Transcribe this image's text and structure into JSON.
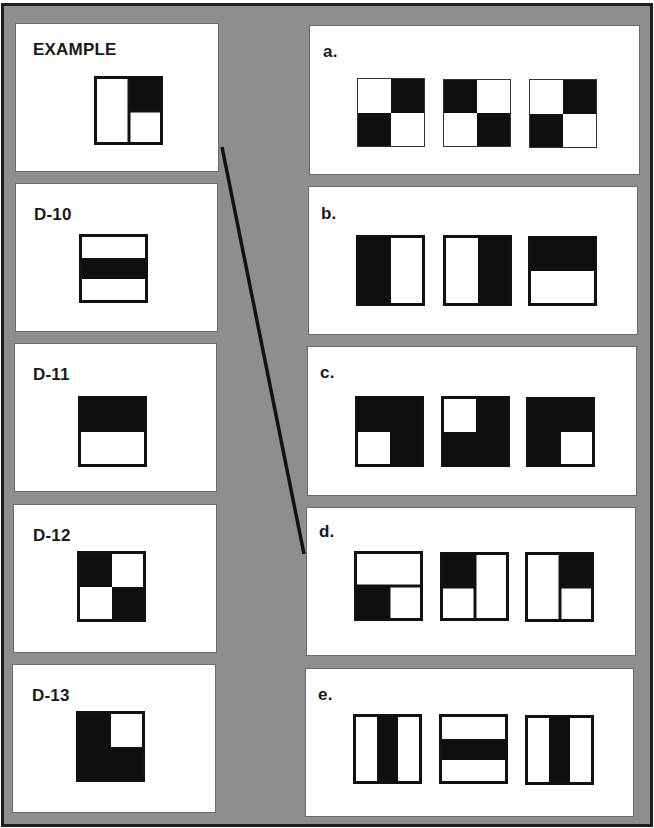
{
  "figure_legend": "fills are rectangles in percent of figure box [x,y,w,h]; dividers are internal black lines",
  "colors": {
    "background": "#8e8e8e",
    "panel": "#ffffff",
    "ink": "#111111",
    "frame_border": "#1e1e1e"
  },
  "left_panels": [
    {
      "id": "example",
      "label": "EXAMPLE",
      "box": [
        15,
        23,
        204,
        149
      ],
      "label_pos": [
        17,
        17
      ],
      "figure": {
        "box": [
          78,
          52,
          69,
          69
        ],
        "fills": [
          [
            50,
            0,
            50,
            50
          ]
        ],
        "v": [
          [
            50,
            0,
            100
          ]
        ],
        "h": [
          [
            50,
            50,
            100
          ]
        ]
      }
    },
    {
      "id": "d10",
      "label": "D-10",
      "box": [
        15,
        183,
        203,
        149
      ],
      "label_pos": [
        18,
        22
      ],
      "figure": {
        "box": [
          63,
          50,
          69,
          69
        ],
        "fills": [
          [
            0,
            33,
            100,
            33
          ]
        ],
        "v": [],
        "h": []
      }
    },
    {
      "id": "d11",
      "label": "D-11",
      "box": [
        14,
        343,
        203,
        149
      ],
      "label_pos": [
        18,
        22
      ],
      "figure": {
        "box": [
          63,
          52,
          69,
          71
        ],
        "fills": [
          [
            0,
            0,
            100,
            50
          ]
        ],
        "v": [],
        "h": []
      }
    },
    {
      "id": "d12",
      "label": "D-12",
      "box": [
        13,
        504,
        204,
        149
      ],
      "label_pos": [
        19,
        22
      ],
      "figure": {
        "box": [
          63,
          46,
          69,
          71
        ],
        "fills": [
          [
            0,
            0,
            50,
            50
          ],
          [
            50,
            50,
            50,
            50
          ]
        ],
        "v": [],
        "h": []
      }
    },
    {
      "id": "d13",
      "label": "D-13",
      "box": [
        12,
        664,
        204,
        149
      ],
      "label_pos": [
        19,
        22
      ],
      "figure": {
        "box": [
          63,
          46,
          69,
          71
        ],
        "fills": [
          [
            0,
            0,
            50,
            100
          ],
          [
            50,
            50,
            50,
            50
          ]
        ],
        "v": [],
        "h": []
      }
    }
  ],
  "right_panels": [
    {
      "id": "a",
      "label": "a.",
      "box": [
        309,
        25,
        331,
        150
      ],
      "label_pos": [
        13,
        17
      ],
      "thin": true,
      "figures": [
        {
          "box": [
            47,
            52,
            68,
            69
          ],
          "fills": [
            [
              50,
              0,
              50,
              50
            ],
            [
              0,
              50,
              50,
              50
            ]
          ],
          "v": [],
          "h": []
        },
        {
          "box": [
            133,
            53,
            68,
            68
          ],
          "fills": [
            [
              0,
              0,
              50,
              50
            ],
            [
              50,
              50,
              50,
              50
            ]
          ],
          "v": [],
          "h": []
        },
        {
          "box": [
            219,
            53,
            68,
            69
          ],
          "fills": [
            [
              50,
              0,
              50,
              50
            ],
            [
              0,
              50,
              50,
              50
            ]
          ],
          "v": [],
          "h": []
        }
      ]
    },
    {
      "id": "b",
      "label": "b.",
      "box": [
        308,
        186,
        330,
        149
      ],
      "label_pos": [
        12,
        18
      ],
      "figures": [
        {
          "box": [
            47,
            48,
            69,
            71
          ],
          "fills": [
            [
              0,
              0,
              50,
              100
            ]
          ],
          "v": [],
          "h": []
        },
        {
          "box": [
            134,
            48,
            69,
            71
          ],
          "fills": [
            [
              50,
              0,
              50,
              100
            ]
          ],
          "v": [],
          "h": []
        },
        {
          "box": [
            219,
            49,
            69,
            70
          ],
          "fills": [
            [
              0,
              0,
              100,
              50
            ]
          ],
          "v": [],
          "h": []
        }
      ]
    },
    {
      "id": "c",
      "label": "c.",
      "box": [
        307,
        346,
        330,
        150
      ],
      "label_pos": [
        12,
        17
      ],
      "figures": [
        {
          "box": [
            47,
            49,
            69,
            71
          ],
          "fills": [
            [
              0,
              0,
              100,
              50
            ],
            [
              50,
              50,
              50,
              50
            ]
          ],
          "v": [],
          "h": []
        },
        {
          "box": [
            133,
            49,
            69,
            71
          ],
          "fills": [
            [
              50,
              0,
              50,
              50
            ],
            [
              0,
              50,
              100,
              50
            ]
          ],
          "v": [],
          "h": []
        },
        {
          "box": [
            218,
            50,
            69,
            70
          ],
          "fills": [
            [
              0,
              0,
              100,
              50
            ],
            [
              0,
              50,
              50,
              50
            ]
          ],
          "v": [],
          "h": []
        }
      ]
    },
    {
      "id": "d",
      "label": "d.",
      "box": [
        306,
        507,
        330,
        149
      ],
      "label_pos": [
        12,
        15
      ],
      "figures": [
        {
          "box": [
            47,
            43,
            69,
            70
          ],
          "fills": [
            [
              0,
              50,
              50,
              50
            ]
          ],
          "v": [
            [
              50,
              50,
              100
            ]
          ],
          "h": [
            [
              50,
              0,
              100
            ]
          ]
        },
        {
          "box": [
            133,
            44,
            69,
            69
          ],
          "fills": [
            [
              0,
              0,
              50,
              50
            ]
          ],
          "v": [
            [
              50,
              0,
              100
            ]
          ],
          "h": [
            [
              50,
              0,
              50
            ]
          ]
        },
        {
          "box": [
            218,
            44,
            69,
            70
          ],
          "fills": [
            [
              50,
              0,
              50,
              50
            ]
          ],
          "v": [
            [
              50,
              0,
              100
            ]
          ],
          "h": [
            [
              50,
              50,
              100
            ]
          ]
        }
      ]
    },
    {
      "id": "e",
      "label": "e.",
      "box": [
        305,
        668,
        329,
        149
      ],
      "label_pos": [
        12,
        17
      ],
      "figures": [
        {
          "box": [
            47,
            45,
            69,
            70
          ],
          "fills": [
            [
              34,
              0,
              33,
              100
            ]
          ],
          "v": [],
          "h": []
        },
        {
          "box": [
            133,
            45,
            69,
            70
          ],
          "fills": [
            [
              0,
              34,
              100,
              33
            ]
          ],
          "v": [],
          "h": []
        },
        {
          "box": [
            219,
            46,
            69,
            70
          ],
          "fills": [
            [
              34,
              0,
              33,
              100
            ]
          ],
          "v": [],
          "h": []
        }
      ]
    }
  ],
  "connector": {
    "from": "example",
    "to": "d",
    "x1": 222,
    "y1": 147,
    "x2": 304,
    "y2": 554,
    "color": "#111111",
    "width": 3.5
  }
}
